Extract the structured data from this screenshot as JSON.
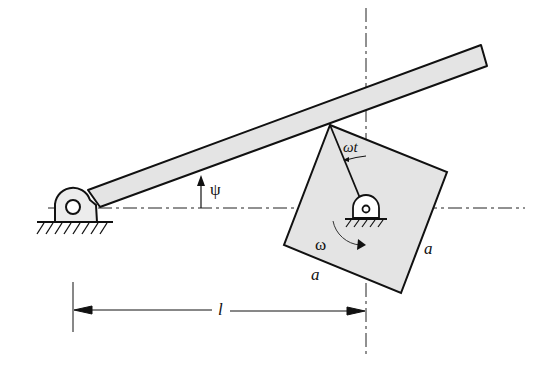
{
  "diagram": {
    "type": "mechanism",
    "colors": {
      "stroke": "#111111",
      "fill": "#e6e6e6",
      "background": "#ffffff"
    },
    "labels": {
      "psi": "ψ",
      "omega_t": "ωt",
      "omega": "ω",
      "side_a_bottom": "a",
      "side_a_right": "a",
      "length_l": "l"
    },
    "elements": [
      {
        "name": "rocker-arm",
        "pivot": "fixed-ground-left"
      },
      {
        "name": "square-plate",
        "side": "a",
        "rotation": "ω"
      },
      {
        "name": "crank",
        "angle": "ωt"
      },
      {
        "name": "fixed-pivot-center"
      },
      {
        "name": "dimension-l"
      }
    ]
  }
}
